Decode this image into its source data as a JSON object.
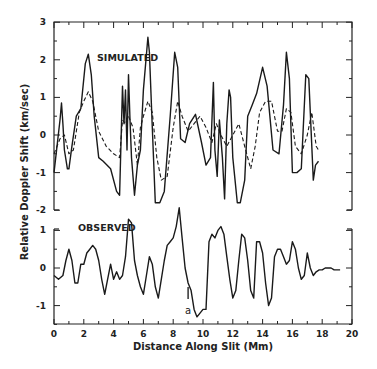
{
  "chart_data": {
    "type": "line",
    "xlabel": "Distance Along Slit (Mm)",
    "ylabel": "Relative Doppler Shift (km/sec)",
    "xlim": [
      0,
      20
    ],
    "xticks": [
      "0",
      "2",
      "4",
      "6",
      "8",
      "10",
      "12",
      "14",
      "16",
      "18",
      "20"
    ],
    "panels": [
      {
        "label": "SIMULATED",
        "ylim": [
          -2,
          3
        ],
        "yticks": [
          "3",
          "2",
          "1",
          "0",
          "-1",
          "-2"
        ],
        "series": [
          {
            "name": "simulated (solid)",
            "style": "solid",
            "x": [
              0,
              0.2,
              0.4,
              0.5,
              0.6,
              0.7,
              0.9,
              1.0,
              1.2,
              1.5,
              1.8,
              2.1,
              2.3,
              2.5,
              2.7,
              3.0,
              3.3,
              3.8,
              4.2,
              4.4,
              4.6,
              4.7,
              4.8,
              4.9,
              5.0,
              5.1,
              5.2,
              5.4,
              5.6,
              5.8,
              6.0,
              6.3,
              6.4,
              6.6,
              6.8,
              7.1,
              7.4,
              7.8,
              8.1,
              8.3,
              8.5,
              8.8,
              9.1,
              9.5,
              9.9,
              10.2,
              10.5,
              10.7,
              10.8,
              10.95,
              11.1,
              11.3,
              11.45,
              11.6,
              11.75,
              11.85,
              12.0,
              12.3,
              12.5,
              12.8,
              13.0,
              13.3,
              13.6,
              14.0,
              14.3,
              14.7,
              15.1,
              15.4,
              15.6,
              15.8,
              16.0,
              16.3,
              16.6,
              16.9,
              17.1,
              17.4,
              17.55,
              17.75
            ],
            "y": [
              -1.0,
              -0.3,
              0.4,
              0.85,
              0.3,
              -0.4,
              -0.9,
              -0.9,
              -0.3,
              0.5,
              0.7,
              1.9,
              2.15,
              1.6,
              0.5,
              -0.6,
              -0.7,
              -0.9,
              -1.5,
              -1.6,
              1.3,
              0.3,
              1.2,
              -0.4,
              1.6,
              0.4,
              -0.6,
              -1.6,
              -0.8,
              -0.4,
              1.2,
              2.6,
              2.2,
              0.2,
              -1.8,
              -1.8,
              -1.5,
              0.5,
              2.2,
              1.8,
              -0.1,
              -0.2,
              0.3,
              0.55,
              -0.2,
              -0.8,
              -0.6,
              1.4,
              -0.4,
              -1.1,
              0.4,
              -0.6,
              -1.7,
              0.3,
              1.2,
              1.0,
              -0.6,
              -1.8,
              -1.8,
              -1.2,
              0.5,
              0.8,
              1.1,
              1.8,
              1.3,
              -0.4,
              -0.5,
              0.8,
              2.2,
              1.5,
              -1.0,
              -1.0,
              -0.9,
              1.6,
              1.5,
              -1.2,
              -0.8,
              -0.7
            ]
          },
          {
            "name": "simulated (smoothed, dashed)",
            "style": "dashed",
            "x": [
              0,
              0.4,
              0.7,
              1.0,
              1.3,
              1.7,
              2.0,
              2.3,
              2.6,
              3.0,
              3.5,
              4.0,
              4.4,
              4.6,
              4.8,
              5.0,
              5.3,
              5.6,
              5.8,
              6.0,
              6.3,
              6.6,
              6.9,
              7.2,
              7.6,
              8.0,
              8.3,
              8.6,
              9.0,
              9.4,
              9.8,
              10.2,
              10.6,
              10.9,
              11.2,
              11.6,
              12.0,
              12.4,
              12.8,
              13.2,
              13.5,
              13.8,
              14.2,
              14.6,
              15.0,
              15.3,
              15.6,
              15.9,
              16.2,
              16.6,
              17.0,
              17.3,
              17.6,
              17.75
            ],
            "y": [
              -0.5,
              -0.1,
              0.0,
              -0.5,
              -0.4,
              0.6,
              0.9,
              1.15,
              0.9,
              0.1,
              -0.3,
              -0.5,
              -0.6,
              0.4,
              0.3,
              0.5,
              0.2,
              -0.8,
              0.2,
              0.5,
              0.9,
              0.6,
              -0.6,
              -1.2,
              -1.1,
              0.2,
              0.9,
              0.5,
              0.1,
              0.3,
              0.5,
              0.2,
              -0.2,
              0.3,
              0.0,
              -0.3,
              0.0,
              0.3,
              -0.3,
              -0.9,
              -0.3,
              0.6,
              0.9,
              0.9,
              0.1,
              0.1,
              0.7,
              0.6,
              -0.3,
              -0.5,
              0.0,
              0.6,
              -0.3,
              -0.4
            ]
          }
        ]
      },
      {
        "label": "OBSERVED",
        "ylim": [
          -1.5,
          1.1
        ],
        "yticks": [
          "1",
          "0",
          "-1"
        ],
        "series": [
          {
            "name": "observed",
            "style": "solid",
            "x": [
              0,
              0.3,
              0.6,
              0.8,
              1.0,
              1.2,
              1.4,
              1.6,
              1.8,
              2.0,
              2.2,
              2.4,
              2.6,
              2.8,
              3.0,
              3.2,
              3.4,
              3.6,
              3.8,
              4.0,
              4.2,
              4.4,
              4.6,
              4.8,
              5.0,
              5.2,
              5.4,
              5.6,
              5.8,
              6.0,
              6.2,
              6.4,
              6.6,
              6.8,
              7.0,
              7.2,
              7.4,
              7.6,
              7.8,
              8.0,
              8.2,
              8.4,
              8.6,
              8.8,
              9.0,
              9.2,
              9.4,
              9.6,
              9.8,
              10.0,
              10.2,
              10.4,
              10.6,
              10.8,
              11.0,
              11.2,
              11.4,
              11.6,
              11.8,
              12.0,
              12.2,
              12.4,
              12.6,
              12.8,
              13.0,
              13.2,
              13.4,
              13.6,
              13.8,
              14.0,
              14.2,
              14.4,
              14.6,
              14.8,
              15.0,
              15.2,
              15.4,
              15.6,
              15.8,
              16.0,
              16.2,
              16.4,
              16.6,
              16.8,
              17.0,
              17.2,
              17.4,
              17.6,
              17.8,
              18.0,
              18.2,
              18.4,
              18.6,
              18.8,
              19.0,
              19.2
            ],
            "y": [
              -0.2,
              -0.3,
              -0.2,
              0.2,
              0.5,
              0.2,
              -0.4,
              -0.4,
              0.1,
              0.1,
              0.4,
              0.5,
              0.6,
              0.5,
              0.2,
              -0.3,
              -0.7,
              -0.3,
              0.1,
              -0.3,
              -0.1,
              -0.3,
              -0.2,
              0.3,
              1.3,
              1.2,
              0.2,
              -0.2,
              -0.5,
              -0.7,
              -0.2,
              0.3,
              0.1,
              -0.5,
              -0.8,
              -0.3,
              0.2,
              0.6,
              0.7,
              0.8,
              1.1,
              1.6,
              0.8,
              0.0,
              -0.4,
              -0.6,
              -1.1,
              -1.3,
              -1.2,
              -1.1,
              -1.1,
              0.7,
              0.9,
              0.8,
              1.0,
              1.1,
              0.9,
              0.3,
              -0.3,
              -0.8,
              -0.6,
              0.2,
              0.9,
              0.8,
              0.2,
              -0.6,
              -0.8,
              0.7,
              0.7,
              0.4,
              -0.4,
              -1.0,
              -0.8,
              0.3,
              0.5,
              0.5,
              0.3,
              0.1,
              0.2,
              0.7,
              0.5,
              0.0,
              -0.3,
              -0.2,
              0.4,
              0.0,
              -0.2,
              -0.1,
              -0.05,
              -0.05,
              0,
              0,
              0,
              -0.05,
              -0.05,
              -0.05
            ]
          }
        ],
        "annotations": [
          {
            "text": "a",
            "x": 9.0,
            "marker": "vertical bar"
          }
        ]
      }
    ]
  }
}
